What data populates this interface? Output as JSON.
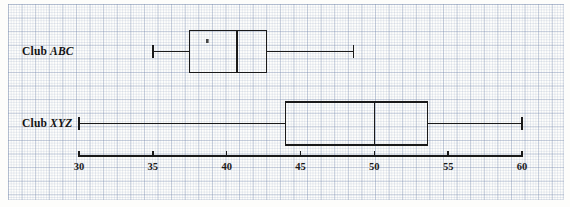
{
  "figure": {
    "title": "",
    "background": "#fdfdfb",
    "grid_color": "#6b7da5",
    "line_color": "#1a1a1a"
  },
  "labels": {
    "abc": {
      "prefix": "Club",
      "name": "ABC"
    },
    "xyz": {
      "prefix": "Club",
      "name": "XYZ"
    }
  },
  "axis": {
    "ticks": [
      "30",
      "35",
      "40",
      "45",
      "50",
      "55",
      "60"
    ]
  },
  "chart_data": {
    "type": "box",
    "title": "",
    "xlabel": "",
    "ylabel": "",
    "orientation": "horizontal",
    "xlim": [
      30,
      60
    ],
    "xticks": [
      30,
      35,
      40,
      45,
      50,
      55,
      60
    ],
    "grid": true,
    "legend": "none",
    "categories": [
      "Club ABC",
      "Club XYZ"
    ],
    "series": [
      {
        "name": "Club ABC",
        "min": 35,
        "q1": 37.5,
        "median": 40.7,
        "q3": 42.7,
        "max": 48.6,
        "outliers": []
      },
      {
        "name": "Club XYZ",
        "min": 30,
        "q1": 44,
        "median": 50,
        "q3": 53.6,
        "max": 60,
        "outliers": []
      }
    ]
  }
}
